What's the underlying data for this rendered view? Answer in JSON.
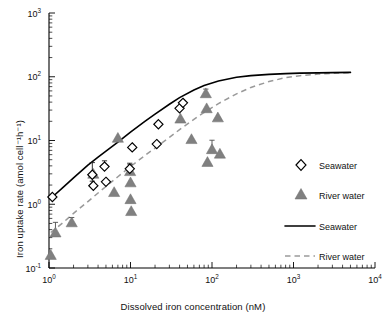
{
  "chart_data": {
    "type": "scatter",
    "title": "",
    "xlabel": "Dissolved iron concentration (nM)",
    "ylabel": "Iron uptake rate (amol cell⁻¹h⁻¹)",
    "xscale": "log",
    "yscale": "log",
    "xlim": [
      1,
      10000
    ],
    "ylim": [
      0.1,
      1000
    ],
    "grid": false,
    "xticks": [
      1,
      10,
      100,
      1000,
      10000
    ],
    "xticklabels": [
      "10⁰",
      "10¹",
      "10²",
      "10³",
      "10⁴"
    ],
    "yticks": [
      0.1,
      1,
      10,
      100,
      1000
    ],
    "yticklabels": [
      "10⁻¹",
      "10⁰",
      "10¹",
      "10²",
      "10³"
    ],
    "legend_position": "right-middle",
    "legend_entries": [
      {
        "label": "Seawater",
        "marker": "open-diamond",
        "color": "#ffffff",
        "edge": "#000000"
      },
      {
        "label": "River water",
        "marker": "filled-triangle",
        "color": "#808080",
        "edge": "#6e6e6e"
      },
      {
        "label": "Seawater",
        "marker": "solid-line",
        "color": "#000000"
      },
      {
        "label": "River water",
        "marker": "dashed-line",
        "color": "#9a9a9a"
      }
    ],
    "series": [
      {
        "name": "Seawater",
        "marker": "open-diamond",
        "points": [
          {
            "x": 1.1,
            "y": 1.3,
            "yerr_lo": 0,
            "yerr_hi": 0
          },
          {
            "x": 3.4,
            "y": 2.9,
            "yerr_lo": 0.6,
            "yerr_hi": 1.6
          },
          {
            "x": 3.5,
            "y": 1.95,
            "yerr_lo": 0,
            "yerr_hi": 0
          },
          {
            "x": 4.8,
            "y": 3.9,
            "yerr_lo": 0,
            "yerr_hi": 0.9
          },
          {
            "x": 5.0,
            "y": 2.25,
            "yerr_lo": 0,
            "yerr_hi": 0
          },
          {
            "x": 9.8,
            "y": 3.6,
            "yerr_lo": 0,
            "yerr_hi": 0.8
          },
          {
            "x": 10.5,
            "y": 7.8,
            "yerr_lo": 0,
            "yerr_hi": 0
          },
          {
            "x": 21.0,
            "y": 8.8,
            "yerr_lo": 0,
            "yerr_hi": 0
          },
          {
            "x": 22.0,
            "y": 18.0,
            "yerr_lo": 0,
            "yerr_hi": 0
          },
          {
            "x": 40.0,
            "y": 32.0,
            "yerr_lo": 0,
            "yerr_hi": 0
          },
          {
            "x": 44.0,
            "y": 39.0,
            "yerr_lo": 0,
            "yerr_hi": 0
          }
        ]
      },
      {
        "name": "River water",
        "marker": "filled-triangle",
        "points": [
          {
            "x": 1.05,
            "y": 0.16,
            "yerr_lo": 0,
            "yerr_hi": 0
          },
          {
            "x": 1.2,
            "y": 0.36,
            "yerr_lo": 0,
            "yerr_hi": 0.16
          },
          {
            "x": 1.9,
            "y": 0.52,
            "yerr_lo": 0,
            "yerr_hi": 0.1
          },
          {
            "x": 3.5,
            "y": 3.0,
            "yerr_lo": 0,
            "yerr_hi": 0
          },
          {
            "x": 6.3,
            "y": 1.55,
            "yerr_lo": 0,
            "yerr_hi": 0
          },
          {
            "x": 7.0,
            "y": 11.0,
            "yerr_lo": 0,
            "yerr_hi": 0
          },
          {
            "x": 9.9,
            "y": 3.3,
            "yerr_lo": 0,
            "yerr_hi": 0.9
          },
          {
            "x": 10.0,
            "y": 2.2,
            "yerr_lo": 0,
            "yerr_hi": 0
          },
          {
            "x": 10.0,
            "y": 1.2,
            "yerr_lo": 0,
            "yerr_hi": 0
          },
          {
            "x": 10.2,
            "y": 0.78,
            "yerr_lo": 0,
            "yerr_hi": 0
          },
          {
            "x": 41.0,
            "y": 22.0,
            "yerr_lo": 0,
            "yerr_hi": 0
          },
          {
            "x": 56.0,
            "y": 10.5,
            "yerr_lo": 0,
            "yerr_hi": 0
          },
          {
            "x": 84.0,
            "y": 55.0,
            "yerr_lo": 5.0,
            "yerr_hi": 9.0
          },
          {
            "x": 86.0,
            "y": 32.0,
            "yerr_lo": 0,
            "yerr_hi": 0
          },
          {
            "x": 88.0,
            "y": 4.6,
            "yerr_lo": 0,
            "yerr_hi": 0
          },
          {
            "x": 100.0,
            "y": 7.3,
            "yerr_lo": 0,
            "yerr_hi": 2.8
          },
          {
            "x": 118.0,
            "y": 23.0,
            "yerr_lo": 0,
            "yerr_hi": 0
          },
          {
            "x": 125.0,
            "y": 6.2,
            "yerr_lo": 0,
            "yerr_hi": 0
          }
        ]
      }
    ],
    "fits": [
      {
        "name": "Seawater",
        "style": "solid",
        "color": "#000000",
        "model": "saturation",
        "x": [
          1.1,
          1.5,
          2,
          3,
          4,
          5,
          7,
          10,
          15,
          20,
          30,
          40,
          60,
          80,
          120,
          200,
          300,
          500,
          800,
          1200,
          2000,
          3000,
          5000
        ],
        "y": [
          1.3,
          1.85,
          2.6,
          4.1,
          5.5,
          6.8,
          9.4,
          13.5,
          20,
          26,
          37,
          47,
          62,
          73,
          86,
          98,
          104,
          109,
          112,
          114,
          115,
          116,
          117
        ]
      },
      {
        "name": "River water",
        "style": "dashed",
        "color": "#9a9a9a",
        "model": "saturation",
        "x": [
          1.05,
          1.5,
          2,
          3,
          4,
          5,
          7,
          10,
          15,
          20,
          30,
          40,
          60,
          80,
          120,
          200,
          300,
          500,
          800,
          1200,
          2000,
          3000,
          5000
        ],
        "y": [
          0.36,
          0.52,
          0.72,
          1.1,
          1.5,
          1.9,
          2.7,
          3.9,
          5.8,
          7.6,
          11.2,
          14.8,
          21.5,
          27.5,
          38,
          54,
          68,
          84,
          97,
          104,
          110,
          113,
          116
        ]
      }
    ]
  },
  "axes": {
    "x_title": "Dissolved iron concentration (nM)",
    "y_title": "Iron uptake rate (amol cell⁻¹h⁻¹)"
  },
  "legend": {
    "items": [
      {
        "label": "Seawater",
        "key": "seawater-marker"
      },
      {
        "label": "River water",
        "key": "riverwater-marker"
      },
      {
        "label": "Seawater",
        "key": "seawater-line"
      },
      {
        "label": "River water",
        "key": "riverwater-line"
      }
    ]
  }
}
